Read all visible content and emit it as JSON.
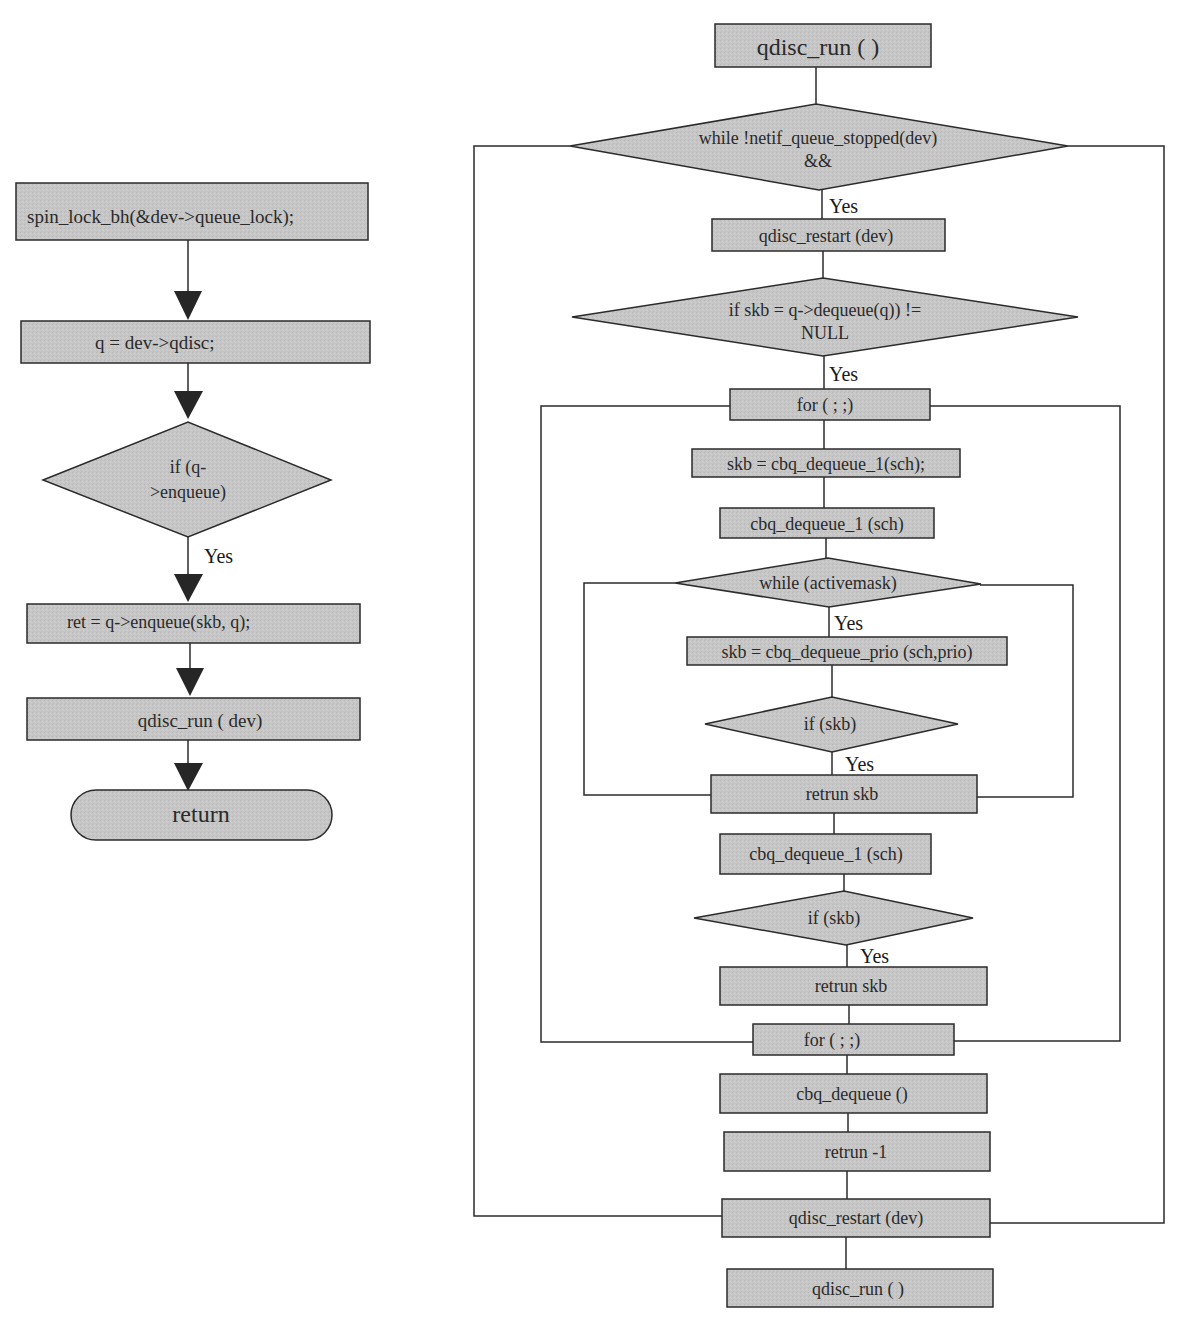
{
  "colors": {
    "node_fill": "#c4c4c4",
    "node_stroke": "#333333",
    "line": "#2b2b2b",
    "arrow": "#262626",
    "background": "#ffffff"
  },
  "left_flow": {
    "nodes": [
      {
        "id": "spin-lock",
        "shape": "rect",
        "lines": [
          "spin_lock_bh(&dev->queue_lock);"
        ]
      },
      {
        "id": "assign-qdisc",
        "shape": "rect",
        "lines": [
          "q = dev->qdisc;"
        ]
      },
      {
        "id": "if-enqueue",
        "shape": "diamond",
        "lines": [
          "if (q-",
          ">enqueue)"
        ]
      },
      {
        "id": "enqueue-call",
        "shape": "rect",
        "lines": [
          "ret = q->enqueue(skb, q);"
        ]
      },
      {
        "id": "qdisc-run-dev",
        "shape": "rect",
        "lines": [
          "qdisc_run ( dev)"
        ]
      },
      {
        "id": "return",
        "shape": "terminator",
        "lines": [
          "return"
        ]
      }
    ],
    "edge_labels": [
      {
        "text": "Yes",
        "from": "if-enqueue",
        "to": "enqueue-call"
      }
    ]
  },
  "right_flow": {
    "nodes": [
      {
        "id": "qdisc-run-top",
        "shape": "rect",
        "lines": [
          "qdisc_run ( )"
        ]
      },
      {
        "id": "while-netif",
        "shape": "diamond",
        "lines": [
          "while !netif_queue_stopped(dev)",
          "&&"
        ]
      },
      {
        "id": "qdisc-restart-1",
        "shape": "rect",
        "lines": [
          "qdisc_restart (dev)"
        ]
      },
      {
        "id": "if-dequeue-null",
        "shape": "diamond",
        "lines": [
          "if skb = q->dequeue(q)) !=",
          "NULL"
        ]
      },
      {
        "id": "for-loop-top",
        "shape": "rect",
        "lines": [
          "for  ( ; ;)"
        ]
      },
      {
        "id": "skb-dequeue-1",
        "shape": "rect",
        "lines": [
          "skb = cbq_dequeue_1(sch);"
        ]
      },
      {
        "id": "cbq-dequeue-1-a",
        "shape": "rect",
        "lines": [
          "cbq_dequeue_1  (sch)"
        ]
      },
      {
        "id": "while-activemask",
        "shape": "diamond",
        "lines": [
          "while (activemask)"
        ]
      },
      {
        "id": "skb-dequeue-prio",
        "shape": "rect",
        "lines": [
          "skb = cbq_dequeue_prio (sch,prio)"
        ]
      },
      {
        "id": "if-skb-1",
        "shape": "diamond",
        "lines": [
          "if (skb)"
        ]
      },
      {
        "id": "return-skb-1",
        "shape": "rect",
        "lines": [
          "retrun skb"
        ]
      },
      {
        "id": "cbq-dequeue-1-b",
        "shape": "rect",
        "lines": [
          "cbq_dequeue_1  (sch)"
        ]
      },
      {
        "id": "if-skb-2",
        "shape": "diamond",
        "lines": [
          "if (skb)"
        ]
      },
      {
        "id": "return-skb-2",
        "shape": "rect",
        "lines": [
          "retrun skb"
        ]
      },
      {
        "id": "for-loop-bottom",
        "shape": "rect",
        "lines": [
          "for  ( ; ;)"
        ]
      },
      {
        "id": "cbq-dequeue",
        "shape": "rect",
        "lines": [
          "cbq_dequeue ()"
        ]
      },
      {
        "id": "return-minus-1",
        "shape": "rect",
        "lines": [
          "retrun -1"
        ]
      },
      {
        "id": "qdisc-restart-2",
        "shape": "rect",
        "lines": [
          "qdisc_restart (dev)"
        ]
      },
      {
        "id": "qdisc-run-bottom",
        "shape": "rect",
        "lines": [
          "qdisc_run ( )"
        ]
      }
    ],
    "edge_labels": [
      {
        "text": "Yes",
        "from": "while-netif",
        "to": "qdisc-restart-1"
      },
      {
        "text": "Yes",
        "from": "if-dequeue-null",
        "to": "for-loop-top"
      },
      {
        "text": "Yes",
        "from": "while-activemask",
        "to": "skb-dequeue-prio"
      },
      {
        "text": "Yes",
        "from": "if-skb-1",
        "to": "return-skb-1"
      },
      {
        "text": "Yes",
        "from": "if-skb-2",
        "to": "return-skb-2"
      }
    ],
    "loops": [
      {
        "id": "outer-while-loop",
        "from": "while-netif",
        "to": "qdisc-restart-2"
      },
      {
        "id": "for-loop",
        "from": "for-loop-top",
        "to": "for-loop-bottom"
      },
      {
        "id": "activemask-loop",
        "from": "while-activemask",
        "to": "return-skb-1"
      }
    ]
  }
}
